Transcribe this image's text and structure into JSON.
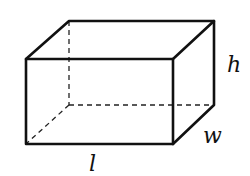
{
  "diagram": {
    "type": "rectangular-prism",
    "labels": {
      "height": "h",
      "width": "w",
      "length": "l"
    },
    "colors": {
      "stroke": "#111111",
      "background": "#ffffff"
    }
  }
}
